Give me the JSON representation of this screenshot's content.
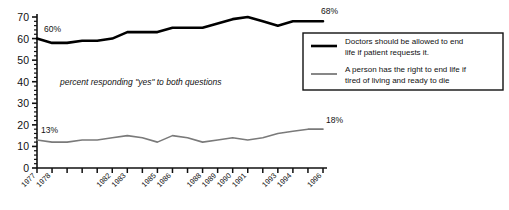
{
  "chart_data": {
    "type": "line",
    "title": "",
    "xlabel": "",
    "ylabel": "",
    "ylim": [
      0,
      70
    ],
    "ytick_values": [
      0,
      10,
      20,
      30,
      40,
      50,
      60,
      70
    ],
    "ytick_labels": [
      "0",
      "10",
      "20",
      "30",
      "40",
      "50",
      "60",
      "70"
    ],
    "minor_y_ticks": true,
    "grid": false,
    "x": [
      1977,
      1978,
      1979,
      1980,
      1981,
      1982,
      1983,
      1984,
      1985,
      1986,
      1987,
      1988,
      1989,
      1990,
      1991,
      1992,
      1993,
      1994,
      1995,
      1996
    ],
    "xtick_labels": [
      "1977",
      "1978",
      "",
      "",
      "",
      "1982",
      "1983",
      "",
      "1985",
      "1986",
      "",
      "1988",
      "1989",
      "1990",
      "1991",
      "",
      "1993",
      "1994",
      "",
      "1996"
    ],
    "annotation": "percent responding \"yes\" to both questions",
    "legend_position": "right",
    "series": [
      {
        "name": "Doctors should be allowed to end life if patient requests it.",
        "color": "#000000",
        "width": 2.6,
        "start_label": "60%",
        "end_label": "68%",
        "values": [
          60,
          58,
          58,
          59,
          59,
          60,
          63,
          63,
          63,
          65,
          65,
          65,
          67,
          69,
          70,
          68,
          66,
          68,
          68,
          68
        ]
      },
      {
        "name": "A person has the right to end life if tired of living and ready to die",
        "color": "#7a7a7a",
        "width": 1.6,
        "start_label": "13%",
        "end_label": "18%",
        "values": [
          13,
          12,
          12,
          13,
          13,
          14,
          15,
          14,
          12,
          15,
          14,
          12,
          13,
          14,
          13,
          14,
          16,
          17,
          18,
          18
        ]
      }
    ]
  },
  "legend": {
    "items": [
      {
        "label_line1": "Doctors should be allowed to end",
        "label_line2": "life if patient requests it."
      },
      {
        "label_line1": "A person has the right to end life if",
        "label_line2": "tired of living and ready to die"
      }
    ]
  }
}
